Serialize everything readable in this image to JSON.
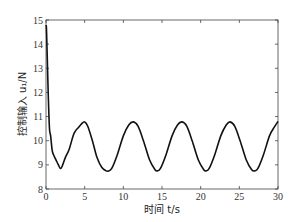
{
  "chart_data": {
    "type": "line",
    "title": "",
    "xlabel": "时间 t/s",
    "ylabel": "控制输入 u₁/N",
    "xlim": [
      0,
      30
    ],
    "ylim": [
      8,
      15
    ],
    "xticks": [
      0,
      5,
      10,
      15,
      20,
      25,
      30
    ],
    "yticks": [
      8,
      9,
      10,
      11,
      12,
      13,
      14,
      15
    ],
    "grid": false,
    "legend": null,
    "series": [
      {
        "name": "u1",
        "color": "#111111",
        "x": [
          0,
          0.05,
          0.1,
          0.2,
          0.3,
          0.45,
          0.6,
          0.8,
          1.0,
          1.3,
          1.6,
          1.85,
          2.1,
          2.5,
          3.0,
          3.5,
          3.8,
          4.2,
          4.6,
          5.0,
          5.4,
          6.0,
          6.6,
          7.2,
          7.8,
          8.1,
          8.5,
          9.2,
          10.0,
          10.7,
          11.3,
          11.9,
          12.6,
          13.4,
          14.1,
          14.4,
          14.8,
          15.5,
          16.3,
          17.0,
          17.6,
          18.2,
          18.9,
          19.7,
          20.4,
          20.7,
          21.1,
          21.8,
          22.6,
          23.3,
          23.8,
          24.4,
          25.1,
          25.9,
          26.6,
          27.0,
          27.4,
          28.1,
          28.9,
          29.5,
          30.0
        ],
        "y": [
          14.8,
          14.7,
          14.2,
          13.0,
          11.8,
          10.5,
          10.2,
          9.6,
          9.4,
          9.2,
          9.0,
          8.85,
          8.95,
          9.3,
          9.65,
          10.2,
          10.4,
          10.55,
          10.7,
          10.78,
          10.6,
          10.0,
          9.3,
          8.9,
          8.75,
          8.75,
          8.85,
          9.4,
          10.2,
          10.65,
          10.78,
          10.6,
          10.0,
          9.2,
          8.8,
          8.75,
          8.85,
          9.4,
          10.2,
          10.65,
          10.78,
          10.6,
          10.0,
          9.2,
          8.8,
          8.75,
          8.85,
          9.4,
          10.2,
          10.65,
          10.78,
          10.6,
          10.0,
          9.2,
          8.8,
          8.75,
          8.85,
          9.4,
          10.2,
          10.55,
          10.8
        ]
      }
    ]
  }
}
